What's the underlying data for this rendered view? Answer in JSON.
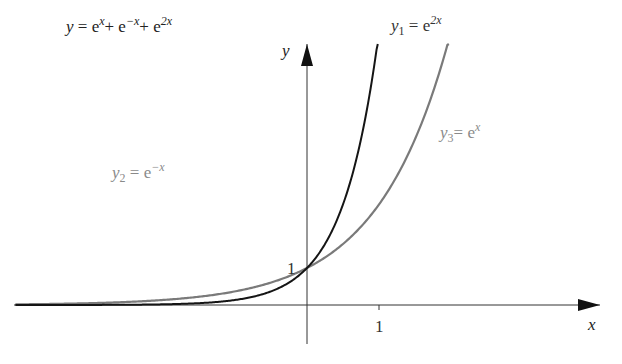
{
  "figure": {
    "axes": {
      "x_label": "x",
      "y_label": "y",
      "tick_x_1": "1",
      "tick_y_1": "1",
      "origin_px": [
        307,
        305
      ],
      "unit_x_px": 72,
      "unit_y_px": 37
    },
    "labels": {
      "sum": {
        "lhs": "y",
        "eq": " = e",
        "t1": "x",
        "plus1": "+ e",
        "t2": "−x",
        "plus2": "+ e",
        "t3": "2x"
      },
      "y1": {
        "name": "y",
        "sub": "1",
        "eq": " = e",
        "exp": "2x"
      },
      "y2": {
        "name": "y",
        "sub": "2",
        "eq": " = e",
        "exp": "−x"
      },
      "y3": {
        "name": "y",
        "sub": "3",
        "eq": "= e",
        "exp": "x"
      }
    },
    "colors": {
      "dark_curve": "#151515",
      "gray_curve": "#7a7a7a",
      "axis": "#333333",
      "dark_label": "#222222",
      "gray_label": "#8a8a8a"
    }
  },
  "chart_data": {
    "type": "line",
    "title": "",
    "xlabel": "x",
    "ylabel": "y",
    "xlim": [
      -4.05,
      4.0
    ],
    "ylim": [
      -1.0,
      7.3
    ],
    "ticks": {
      "x": [
        1
      ],
      "y": [
        1
      ]
    },
    "grid": false,
    "series": [
      {
        "name": "y = e^x + e^-x + e^2x",
        "formula": "exp(x)+exp(-x)+exp(2x)",
        "x_range": [
          -1.96,
          0.75
        ],
        "color": "#151515",
        "minimum": {
          "x": -0.44,
          "y": 2.6
        }
      },
      {
        "name": "y1 = e^2x",
        "formula": "exp(2x)",
        "x_range": [
          -4.05,
          1.0
        ],
        "color": "#151515"
      },
      {
        "name": "y2 = e^-x",
        "formula": "exp(-x)",
        "x_range": [
          -1.96,
          4.0
        ],
        "color": "#7a7a7a"
      },
      {
        "name": "y3 = e^x",
        "formula": "exp(x)",
        "x_range": [
          -4.05,
          1.99
        ],
        "color": "#7a7a7a"
      }
    ],
    "annotations": [
      "1 (intersection at (0,1))"
    ]
  }
}
